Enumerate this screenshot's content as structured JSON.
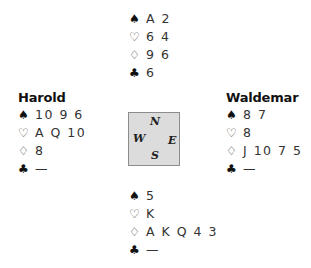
{
  "icons": {
    "spades": "♠",
    "hearts": "♡",
    "diamonds": "♢",
    "clubs": "♣"
  },
  "north": {
    "name": "",
    "spades": "A 2",
    "hearts": "6 4",
    "diamonds": "9 6",
    "clubs": "6"
  },
  "west": {
    "name": "Harold",
    "spades": "10 9 6",
    "hearts": "A Q 10",
    "diamonds": "8",
    "clubs": "—"
  },
  "east": {
    "name": "Waldemar",
    "spades": "8 7",
    "hearts": "8",
    "diamonds": "J 10 7 5",
    "clubs": "—"
  },
  "south": {
    "name": "",
    "spades": "5",
    "hearts": "K",
    "diamonds": "A K Q 4 3",
    "clubs": "—"
  },
  "compass": {
    "n": "N",
    "e": "E",
    "s": "S",
    "w": "W"
  },
  "colors": {
    "compass_fill": "#dcdcdc",
    "compass_border": "#8c8c8c",
    "text": "#222222"
  }
}
